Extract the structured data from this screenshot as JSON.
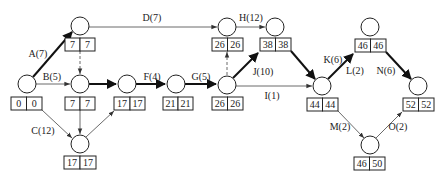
{
  "diagram": {
    "type": "network-planning-diagram",
    "nodes": [
      {
        "id": "n1",
        "es": "0",
        "ls": "0"
      },
      {
        "id": "n2",
        "es": "7",
        "ls": "7"
      },
      {
        "id": "n3",
        "es": "7",
        "ls": "7"
      },
      {
        "id": "n4",
        "es": "17",
        "ls": "17"
      },
      {
        "id": "n5",
        "es": "17",
        "ls": "17"
      },
      {
        "id": "n6",
        "es": "21",
        "ls": "21"
      },
      {
        "id": "n7",
        "es": "26",
        "ls": "26"
      },
      {
        "id": "n8",
        "es": "26",
        "ls": "26"
      },
      {
        "id": "n9",
        "es": "38",
        "ls": "38"
      },
      {
        "id": "n10",
        "es": "44",
        "ls": "44"
      },
      {
        "id": "n11",
        "es": "46",
        "ls": "46"
      },
      {
        "id": "n12",
        "es": "52",
        "ls": "52"
      },
      {
        "id": "n13",
        "es": "46",
        "ls": "50"
      }
    ],
    "edges": [
      {
        "label": "A(7)",
        "from": "n1",
        "to": "n2",
        "critical": true
      },
      {
        "label": "B(5)",
        "from": "n1",
        "to": "n3",
        "critical": false
      },
      {
        "label": "C(12)",
        "from": "n1",
        "to": "n4",
        "critical": false
      },
      {
        "label": "D(7)",
        "from": "n2",
        "to": "n8",
        "critical": false
      },
      {
        "label": "",
        "from": "n2",
        "to": "n3",
        "dummy": true
      },
      {
        "label": "",
        "from": "n3",
        "to": "n4",
        "critical": false
      },
      {
        "label": "",
        "from": "n3",
        "to": "n5",
        "critical": true
      },
      {
        "label": "",
        "from": "n4",
        "to": "n5",
        "critical": false
      },
      {
        "label": "F(4)",
        "from": "n5",
        "to": "n6",
        "critical": true
      },
      {
        "label": "G(5)",
        "from": "n6",
        "to": "n7",
        "critical": true
      },
      {
        "label": "",
        "from": "n7",
        "to": "n8",
        "dummy": true
      },
      {
        "label": "H(12)",
        "from": "n8",
        "to": "n9",
        "critical": false
      },
      {
        "label": "J(10)",
        "from": "n7",
        "to": "n9",
        "critical": true
      },
      {
        "label": "I(1)",
        "from": "n7",
        "to": "n10",
        "critical": false
      },
      {
        "label": "",
        "from": "n9",
        "to": "n10",
        "critical": true
      },
      {
        "label": "K(6)",
        "from": "n10",
        "to": "n11",
        "critical": true
      },
      {
        "label": "L(2)",
        "from": "n10",
        "to": "n11",
        "critical": true
      },
      {
        "label": "N(6)",
        "from": "n11",
        "to": "n12",
        "critical": true
      },
      {
        "label": "M(2)",
        "from": "n10",
        "to": "n13",
        "critical": false
      },
      {
        "label": "O(2)",
        "from": "n13",
        "to": "n12",
        "critical": false
      }
    ]
  }
}
